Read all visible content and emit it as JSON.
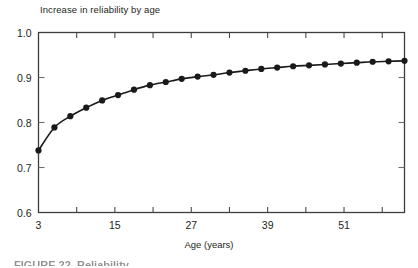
{
  "figure": {
    "title": "Increase in reliability by age",
    "caption_partial": "FIGURE 22. Reliability"
  },
  "axes": {
    "x_title": "Age (years)",
    "x_tick_labels": [
      "3",
      "15",
      "27",
      "39",
      "51"
    ],
    "x_tick_values": [
      3,
      15,
      27,
      39,
      51
    ],
    "y_tick_labels": [
      "0.6",
      "0.7",
      "0.8",
      "0.9",
      "1.0"
    ],
    "y_tick_values": [
      0.6,
      0.7,
      0.8,
      0.9,
      1.0
    ]
  },
  "chart_data": {
    "type": "line",
    "title": "Increase in reliability by age",
    "xlabel": "Age (years)",
    "ylabel": "",
    "xlim": [
      3,
      60.5
    ],
    "ylim": [
      0.6,
      1.0
    ],
    "grid": false,
    "legend": null,
    "marker": "filled-circle",
    "line_color": "#1a1a1a",
    "marker_color": "#1a1a1a",
    "x": [
      3,
      5.5,
      8,
      10.5,
      13,
      15.5,
      18,
      20.5,
      23,
      25.5,
      28,
      30.5,
      33,
      35.5,
      38,
      40.5,
      43,
      45.5,
      48,
      50.5,
      53,
      55.5,
      58,
      60.5
    ],
    "values": [
      0.738,
      0.789,
      0.814,
      0.833,
      0.849,
      0.861,
      0.873,
      0.883,
      0.89,
      0.897,
      0.902,
      0.906,
      0.911,
      0.915,
      0.919,
      0.922,
      0.925,
      0.927,
      0.929,
      0.931,
      0.933,
      0.935,
      0.936,
      0.937
    ],
    "xticks_major": [
      3,
      15,
      27,
      39,
      51
    ],
    "xticks_minor": [
      9,
      21,
      33,
      45,
      57
    ],
    "yticks": [
      0.6,
      0.7,
      0.8,
      0.9,
      1.0
    ]
  }
}
